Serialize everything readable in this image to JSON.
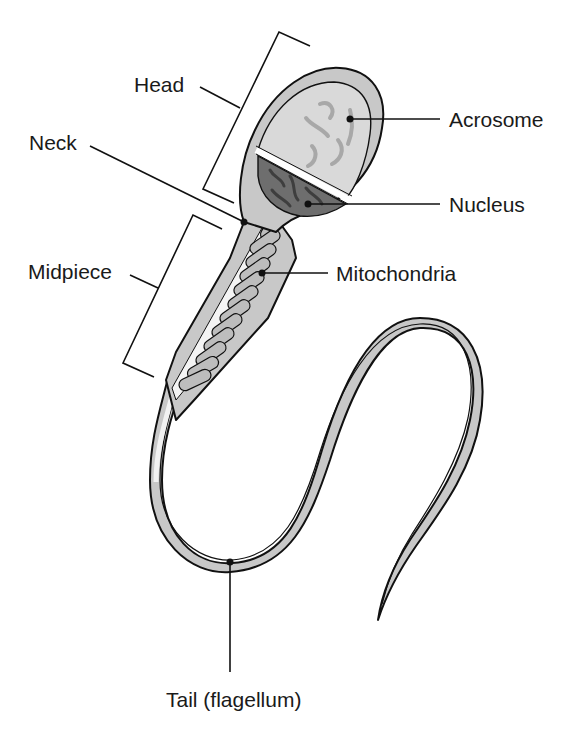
{
  "diagram": {
    "colors": {
      "line": "#111111",
      "body_fill": "#c8c8c8",
      "acrosome_fill": "#d9d9d9",
      "nucleus_fill": "#6e6e6e",
      "mitochondria_fill": "#bdbdbd",
      "core_fill": "#f2f2f2",
      "background": "#ffffff"
    },
    "labels": {
      "head": "Head",
      "neck": "Neck",
      "midpiece": "Midpiece",
      "acrosome": "Acrosome",
      "nucleus": "Nucleus",
      "mitochondria": "Mitochondria",
      "tail": "Tail (flagellum)"
    },
    "regions": [
      {
        "id": "head",
        "label": "Head",
        "type": "bracket"
      },
      {
        "id": "neck",
        "label": "Neck",
        "type": "leader"
      },
      {
        "id": "midpiece",
        "label": "Midpiece",
        "type": "bracket"
      },
      {
        "id": "acrosome",
        "label": "Acrosome",
        "type": "leader"
      },
      {
        "id": "nucleus",
        "label": "Nucleus",
        "type": "leader"
      },
      {
        "id": "mitochondria",
        "label": "Mitochondria",
        "type": "leader"
      },
      {
        "id": "tail",
        "label": "Tail (flagellum)",
        "type": "leader"
      }
    ]
  }
}
